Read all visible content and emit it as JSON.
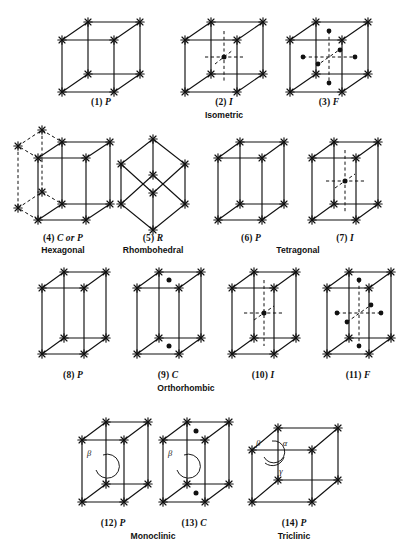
{
  "figure": {
    "vertex_marker": "star-marker",
    "lattice_point_marker": "filled-dot",
    "line_styles": [
      "solid-edge",
      "dashed-hidden-edge"
    ],
    "colors": {
      "ink": "#111111",
      "background": "#ffffff"
    }
  },
  "cells": [
    {
      "number": "(1)",
      "symbol": "P",
      "caption": "(1) P",
      "system": "Isometric",
      "centering": "primitive",
      "interior_points": 0,
      "face_points": 0,
      "dashed": false
    },
    {
      "number": "(2)",
      "symbol": "I",
      "caption": "(2) I",
      "system": "Isometric",
      "centering": "body-centered",
      "interior_points": 1,
      "face_points": 0,
      "dashed": true
    },
    {
      "number": "(3)",
      "symbol": "F",
      "caption": "(3) F",
      "system": "Isometric",
      "centering": "face-centered",
      "interior_points": 0,
      "face_points": 6,
      "dashed": true
    },
    {
      "number": "(4)",
      "symbol": "C or P",
      "caption": "(4) C or P",
      "system": "Hexagonal",
      "centering": "hexagonal-prism",
      "interior_points": 0,
      "face_points": 0,
      "dashed": true
    },
    {
      "number": "(5)",
      "symbol": "R",
      "caption": "(5) R",
      "system": "Rhombohedral",
      "centering": "rhombohedral",
      "interior_points": 0,
      "face_points": 0,
      "dashed": false
    },
    {
      "number": "(6)",
      "symbol": "P",
      "caption": "(6) P",
      "system": "Tetragonal",
      "centering": "primitive",
      "interior_points": 0,
      "face_points": 0,
      "dashed": false
    },
    {
      "number": "(7)",
      "symbol": "I",
      "caption": "(7) I",
      "system": "Tetragonal",
      "centering": "body-centered",
      "interior_points": 1,
      "face_points": 0,
      "dashed": true
    },
    {
      "number": "(8)",
      "symbol": "P",
      "caption": "(8) P",
      "system": "Orthorhombic",
      "centering": "primitive",
      "interior_points": 0,
      "face_points": 0,
      "dashed": false
    },
    {
      "number": "(9)",
      "symbol": "C",
      "caption": "(9) C",
      "system": "Orthorhombic",
      "centering": "base-centered",
      "interior_points": 0,
      "face_points": 2,
      "dashed": false
    },
    {
      "number": "(10)",
      "symbol": "I",
      "caption": "(10) I",
      "system": "Orthorhombic",
      "centering": "body-centered",
      "interior_points": 1,
      "face_points": 0,
      "dashed": true
    },
    {
      "number": "(11)",
      "symbol": "F",
      "caption": "(11) F",
      "system": "Orthorhombic",
      "centering": "face-centered",
      "interior_points": 0,
      "face_points": 6,
      "dashed": true
    },
    {
      "number": "(12)",
      "symbol": "P",
      "caption": "(12) P",
      "system": "Monoclinic",
      "centering": "primitive",
      "interior_points": 0,
      "face_points": 0,
      "dashed": false,
      "angles": [
        "β"
      ]
    },
    {
      "number": "(13)",
      "symbol": "C",
      "caption": "(13) C",
      "system": "Monoclinic",
      "centering": "base-centered",
      "interior_points": 0,
      "face_points": 2,
      "dashed": false,
      "angles": [
        "β"
      ]
    },
    {
      "number": "(14)",
      "symbol": "P",
      "caption": "(14) P",
      "system": "Triclinic",
      "centering": "primitive",
      "interior_points": 0,
      "face_points": 0,
      "dashed": false,
      "angles": [
        "β",
        "α",
        "γ"
      ]
    }
  ],
  "captions": {
    "c1": "(1) ",
    "s1": "P",
    "c2": "(2) ",
    "s2": "I",
    "c3": "(3) ",
    "s3": "F",
    "c4": "(4) ",
    "s4": "C or P",
    "c5": "(5) ",
    "s5": "R",
    "c6": "(6) ",
    "s6": "P",
    "c7": "(7) ",
    "s7": "I",
    "c8": "(8) ",
    "s8": "P",
    "c9": "(9) ",
    "s9": "C",
    "c10": "(10) ",
    "s10": "I",
    "c11": "(11) ",
    "s11": "F",
    "c12": "(12) ",
    "s12": "P",
    "c13": "(13) ",
    "s13": "C",
    "c14": "(14) ",
    "s14": "P"
  },
  "systems": {
    "isometric": "Isometric",
    "hexagonal": "Hexagonal",
    "rhombohedral": "Rhombohedral",
    "tetragonal": "Tetragonal",
    "orthorhombic": "Orthorhombic",
    "monoclinic": "Monoclinic",
    "triclinic": "Triclinic"
  },
  "angle_labels": {
    "alpha": "α",
    "beta": "β",
    "gamma": "γ"
  }
}
